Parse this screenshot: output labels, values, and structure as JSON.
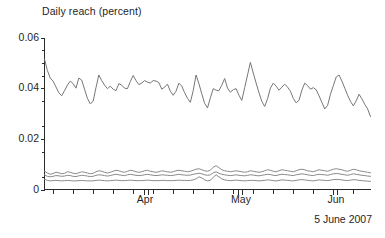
{
  "chart_data": {
    "type": "line",
    "title": "Daily reach (percent)",
    "xlabel": "",
    "ylabel": "Daily reach (percent)",
    "caption": "5 June 2007",
    "grid": false,
    "legend": "none",
    "ylim": [
      0,
      0.06
    ],
    "ytick_labels": [
      "0.06",
      "0.04",
      "0.02",
      "0"
    ],
    "ytick_values": [
      0.06,
      0.04,
      0.02,
      0
    ],
    "xtick_labels": [
      "Apr",
      "May",
      "Jun"
    ],
    "xtick_positions_frac": [
      0.31,
      0.6,
      0.89
    ],
    "x_axis_note": "daily samples, mid-March 2007 through 5 June 2007",
    "series": [
      {
        "name": "series-1-main",
        "color": "#777777",
        "values": [
          0.0515,
          0.047,
          0.044,
          0.0428,
          0.0405,
          0.0382,
          0.037,
          0.039,
          0.0412,
          0.0428,
          0.0418,
          0.04,
          0.044,
          0.0432,
          0.0396,
          0.036,
          0.0338,
          0.0348,
          0.0402,
          0.0452,
          0.043,
          0.0412,
          0.0398,
          0.0408,
          0.0396,
          0.039,
          0.0418,
          0.0412,
          0.04,
          0.0398,
          0.0426,
          0.045,
          0.043,
          0.0414,
          0.042,
          0.043,
          0.0424,
          0.042,
          0.043,
          0.0428,
          0.0422,
          0.0396,
          0.0404,
          0.0416,
          0.0388,
          0.0372,
          0.0388,
          0.042,
          0.0408,
          0.0382,
          0.036,
          0.0344,
          0.039,
          0.0452,
          0.0418,
          0.0378,
          0.034,
          0.0322,
          0.0362,
          0.0398,
          0.0392,
          0.039,
          0.0412,
          0.0438,
          0.04,
          0.0384,
          0.0394,
          0.0398,
          0.0372,
          0.0352,
          0.0402,
          0.0452,
          0.0502,
          0.046,
          0.042,
          0.0382,
          0.0348,
          0.0328,
          0.0358,
          0.04,
          0.042,
          0.0408,
          0.0392,
          0.0404,
          0.0416,
          0.0404,
          0.0388,
          0.036,
          0.0342,
          0.0352,
          0.0392,
          0.042,
          0.041,
          0.0396,
          0.0402,
          0.0394,
          0.037,
          0.0344,
          0.0318,
          0.0332,
          0.0376,
          0.041,
          0.0444,
          0.0452,
          0.0428,
          0.04,
          0.0372,
          0.0348,
          0.033,
          0.035,
          0.0376,
          0.0358,
          0.0336,
          0.0318,
          0.0288
        ]
      },
      {
        "name": "series-2-low-upper",
        "color": "#8a8a8a",
        "values": [
          0.0072,
          0.0065,
          0.006,
          0.0063,
          0.0068,
          0.0066,
          0.0062,
          0.0064,
          0.007,
          0.0068,
          0.0064,
          0.0062,
          0.0066,
          0.007,
          0.0068,
          0.0065,
          0.0062,
          0.0064,
          0.007,
          0.0074,
          0.0072,
          0.0068,
          0.0065,
          0.0068,
          0.0072,
          0.0076,
          0.0074,
          0.007,
          0.0068,
          0.0072,
          0.0076,
          0.0074,
          0.007,
          0.0068,
          0.007,
          0.0074,
          0.0076,
          0.0072,
          0.007,
          0.0068,
          0.007,
          0.0074,
          0.0072,
          0.007,
          0.0068,
          0.007,
          0.0074,
          0.0076,
          0.0074,
          0.0072,
          0.007,
          0.0072,
          0.0076,
          0.008,
          0.0082,
          0.0078,
          0.0074,
          0.0072,
          0.0076,
          0.0088,
          0.0094,
          0.0086,
          0.0078,
          0.0074,
          0.0072,
          0.007,
          0.0072,
          0.0074,
          0.0072,
          0.007,
          0.0068,
          0.007,
          0.0074,
          0.0072,
          0.007,
          0.0068,
          0.007,
          0.0074,
          0.0078,
          0.0076,
          0.0072,
          0.007,
          0.0074,
          0.0078,
          0.0076,
          0.0074,
          0.0072,
          0.007,
          0.0074,
          0.0078,
          0.008,
          0.0078,
          0.0074,
          0.0072,
          0.007,
          0.0074,
          0.0078,
          0.0076,
          0.0074,
          0.0072,
          0.0076,
          0.008,
          0.0082,
          0.008,
          0.0078,
          0.0074,
          0.0072,
          0.0076,
          0.008,
          0.0078,
          0.0074,
          0.0072,
          0.007,
          0.0068,
          0.0066
        ]
      },
      {
        "name": "series-3-low-middle",
        "color": "#8a8a8a",
        "values": [
          0.0058,
          0.0052,
          0.005,
          0.0052,
          0.0055,
          0.0054,
          0.0052,
          0.0053,
          0.0056,
          0.0055,
          0.0052,
          0.0051,
          0.0054,
          0.0056,
          0.0055,
          0.0053,
          0.0051,
          0.0052,
          0.0056,
          0.0058,
          0.0057,
          0.0055,
          0.0053,
          0.0055,
          0.0058,
          0.006,
          0.0058,
          0.0056,
          0.0055,
          0.0058,
          0.006,
          0.0058,
          0.0056,
          0.0055,
          0.0056,
          0.0058,
          0.006,
          0.0058,
          0.0056,
          0.0055,
          0.0056,
          0.0058,
          0.0057,
          0.0056,
          0.0055,
          0.0056,
          0.0058,
          0.006,
          0.0058,
          0.0057,
          0.0056,
          0.0057,
          0.006,
          0.0062,
          0.0064,
          0.0062,
          0.0058,
          0.0056,
          0.0058,
          0.0066,
          0.007,
          0.0064,
          0.006,
          0.0058,
          0.0056,
          0.0055,
          0.0056,
          0.0058,
          0.0056,
          0.0055,
          0.0054,
          0.0056,
          0.0058,
          0.0057,
          0.0055,
          0.0054,
          0.0056,
          0.0058,
          0.006,
          0.0059,
          0.0056,
          0.0055,
          0.0058,
          0.006,
          0.0059,
          0.0058,
          0.0056,
          0.0055,
          0.0058,
          0.006,
          0.0062,
          0.006,
          0.0058,
          0.0056,
          0.0055,
          0.0058,
          0.006,
          0.0059,
          0.0058,
          0.0056,
          0.0059,
          0.0062,
          0.0063,
          0.0062,
          0.006,
          0.0058,
          0.0056,
          0.0059,
          0.0062,
          0.006,
          0.0058,
          0.0056,
          0.0055,
          0.0053,
          0.0052
        ]
      },
      {
        "name": "series-4-low-bottom",
        "color": "#8a8a8a",
        "values": [
          0.004,
          0.0036,
          0.0034,
          0.0035,
          0.0036,
          0.0035,
          0.0034,
          0.0035,
          0.0036,
          0.0035,
          0.0034,
          0.0034,
          0.0035,
          0.0036,
          0.0035,
          0.0034,
          0.0034,
          0.0034,
          0.0036,
          0.0037,
          0.0036,
          0.0035,
          0.0034,
          0.0035,
          0.0036,
          0.0037,
          0.0036,
          0.0035,
          0.0035,
          0.0036,
          0.0037,
          0.0036,
          0.0035,
          0.0035,
          0.0035,
          0.0036,
          0.0037,
          0.0036,
          0.0035,
          0.0035,
          0.0035,
          0.0036,
          0.0036,
          0.0035,
          0.0035,
          0.0035,
          0.0036,
          0.0037,
          0.0036,
          0.0036,
          0.0035,
          0.0036,
          0.0038,
          0.0042,
          0.005,
          0.0046,
          0.0038,
          0.0034,
          0.0036,
          0.0048,
          0.0058,
          0.005,
          0.0042,
          0.0038,
          0.0036,
          0.0035,
          0.0036,
          0.0037,
          0.0036,
          0.0035,
          0.0034,
          0.0035,
          0.0036,
          0.0036,
          0.0035,
          0.0034,
          0.0035,
          0.0036,
          0.0038,
          0.0037,
          0.0035,
          0.0034,
          0.0036,
          0.0038,
          0.0037,
          0.0036,
          0.0035,
          0.0034,
          0.0036,
          0.0038,
          0.0039,
          0.0038,
          0.0036,
          0.0035,
          0.0034,
          0.0036,
          0.0038,
          0.0037,
          0.0036,
          0.0035,
          0.0037,
          0.0039,
          0.004,
          0.0039,
          0.0038,
          0.0036,
          0.0035,
          0.0037,
          0.0039,
          0.0038,
          0.0036,
          0.0035,
          0.0034,
          0.0033,
          0.0032
        ]
      }
    ]
  },
  "chart": {
    "title": "Daily reach (percent)",
    "caption": "5 June 2007",
    "yticks": [
      {
        "label": "0.06",
        "value": 0.06
      },
      {
        "label": "0.04",
        "value": 0.04
      },
      {
        "label": "0.02",
        "value": 0.02
      },
      {
        "label": "0",
        "value": 0
      }
    ],
    "xticks": [
      {
        "label": "Apr",
        "frac": 0.31
      },
      {
        "label": "May",
        "frac": 0.6
      },
      {
        "label": "Jun",
        "frac": 0.89
      }
    ],
    "colors": {
      "axis": "#2b2b2b",
      "series_main": "#777777",
      "series_low": "#8a8a8a",
      "background": "#ffffff",
      "text": "#1f1f1f"
    }
  }
}
